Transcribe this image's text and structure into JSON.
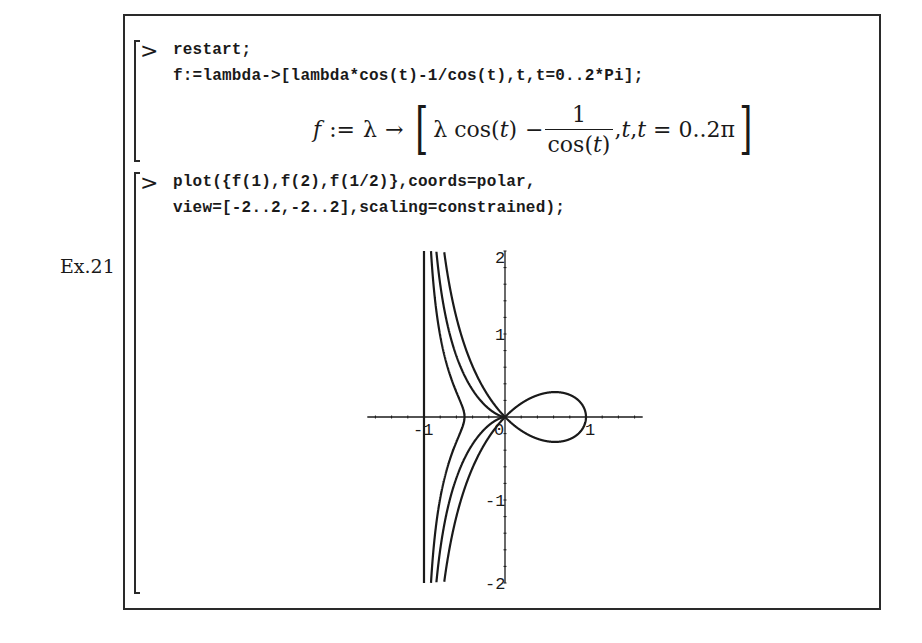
{
  "exercise_label": "Ex.21",
  "prompt_symbol": ">",
  "cells": [
    {
      "input_lines": [
        "restart;",
        "f:=lambda->[lambda*cos(t)-1/cos(t),t,t=0..2*Pi];"
      ],
      "output": {
        "lhs": "f",
        "assign": ":=",
        "lambda": "λ",
        "arrow": "→",
        "open_bracket": "[",
        "term1": "λ cos(",
        "term1_var": "t",
        "term1_close": ")",
        "minus": "−",
        "frac_num": "1",
        "frac_den_prefix": "cos(",
        "frac_den_var": "t",
        "frac_den_suffix": ")",
        "comma1": ",",
        "t1": "t",
        "comma2": ",",
        "t2": "t",
        "range": " = 0..2π",
        "close_bracket": "]"
      }
    },
    {
      "input_lines": [
        "plot({f(1),f(2),f(1/2)},coords=polar,",
        "view=[-2..2,-2..2],scaling=constrained);"
      ]
    }
  ],
  "chart_data": {
    "type": "line",
    "title": "",
    "coords": "polar",
    "curve_formula": "r = lambda*cos(t) - 1/cos(t), t in [0, 2*Pi]",
    "series": [
      {
        "name": "f(1)",
        "lambda": 1
      },
      {
        "name": "f(2)",
        "lambda": 2
      },
      {
        "name": "f(1/2)",
        "lambda": 0.5
      }
    ],
    "xlim": [
      -2,
      2
    ],
    "ylim": [
      -2,
      2
    ],
    "visible_x_range": [
      -1.7,
      1.7
    ],
    "x_ticks": [
      {
        "value": -1,
        "label": "-1"
      },
      {
        "value": 0,
        "label": "0"
      },
      {
        "value": 1,
        "label": "1"
      }
    ],
    "y_ticks": [
      {
        "value": 2,
        "label": "2"
      },
      {
        "value": 1,
        "label": "1"
      },
      {
        "value": -1,
        "label": "-1"
      },
      {
        "value": -2,
        "label": "-2"
      }
    ],
    "asymptote_x": -1,
    "xlabel": "",
    "ylabel": "",
    "grid": false,
    "legend": null,
    "line_color": "#1a1a1a"
  }
}
